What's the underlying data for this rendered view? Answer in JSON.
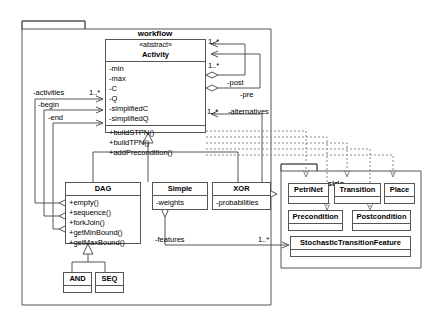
{
  "diagram": {
    "kind": "uml-class-diagram",
    "width": 446,
    "height": 324,
    "line_color": "#555555",
    "dashed_color": "#888888",
    "background": "#ffffff"
  },
  "packages": [
    {
      "id": "workflow",
      "label": "workflow"
    },
    {
      "id": "sirio",
      "label": "sirio"
    }
  ],
  "classes": {
    "activity": {
      "stereotype": "«abstract»",
      "name": "Activity",
      "attributes": [
        "-min",
        "-max",
        "-C",
        "-Q",
        "-simplifiedC",
        "-simplifiedQ"
      ],
      "operations": [
        "+buildSTPN()",
        "+buildTPN()",
        "+addPrecondition()"
      ]
    },
    "dag": {
      "name": "DAG",
      "operations": [
        "+empty()",
        "+sequence()",
        "+forkJoin()",
        "+getMinBound()",
        "+getMaxBound()"
      ]
    },
    "simple": {
      "name": "Simple",
      "attributes": [
        "-weights"
      ]
    },
    "xor": {
      "name": "XOR",
      "attributes": [
        "-probabilities"
      ]
    },
    "and": {
      "name": "AND",
      "attributes": []
    },
    "seq": {
      "name": "SEQ",
      "attributes": []
    },
    "petrinet": {
      "name": "PetriNet",
      "attributes": []
    },
    "transition": {
      "name": "Transition",
      "attributes": []
    },
    "place": {
      "name": "Place",
      "attributes": []
    },
    "precondition": {
      "name": "Precondition",
      "attributes": []
    },
    "postcondition": {
      "name": "Postcondition",
      "attributes": []
    },
    "stochastic_transition_feature": {
      "name": "StochasticTransitionFeature",
      "attributes": []
    }
  },
  "edge_labels": {
    "activities": "-activities",
    "begin": "-begin",
    "end": "-end",
    "post": "-post",
    "pre": "-pre",
    "alternatives": "-alternatives",
    "features": "-features",
    "mult_post": "1..*",
    "mult_pre": "1..*",
    "mult_activities": "1..*",
    "mult_alternatives": "1..*",
    "mult_features": "1..*"
  },
  "relationships": [
    {
      "type": "generalization",
      "from": "dag",
      "to": "activity"
    },
    {
      "type": "generalization",
      "from": "simple",
      "to": "activity"
    },
    {
      "type": "generalization",
      "from": "xor",
      "to": "activity"
    },
    {
      "type": "generalization",
      "from": "and",
      "to": "dag"
    },
    {
      "type": "generalization",
      "from": "seq",
      "to": "dag"
    },
    {
      "type": "aggregation",
      "from": "activity",
      "to": "activity",
      "label": "-post",
      "multiplicity": "1..*"
    },
    {
      "type": "aggregation",
      "from": "activity",
      "to": "activity",
      "label": "-pre",
      "multiplicity": "1..*"
    },
    {
      "type": "aggregation",
      "from": "dag",
      "to": "activity",
      "label": "-activities",
      "multiplicity": "1..*"
    },
    {
      "type": "aggregation",
      "from": "dag",
      "to": "activity",
      "label": "-begin"
    },
    {
      "type": "aggregation",
      "from": "dag",
      "to": "activity",
      "label": "-end"
    },
    {
      "type": "aggregation",
      "from": "xor",
      "to": "activity",
      "label": "-alternatives",
      "multiplicity": "1..*"
    },
    {
      "type": "aggregation",
      "from": "simple",
      "to": "stochastic_transition_feature",
      "label": "-features",
      "multiplicity": "1..*"
    },
    {
      "type": "dependency",
      "from": "activity",
      "to": "petrinet"
    },
    {
      "type": "dependency",
      "from": "activity",
      "to": "transition"
    },
    {
      "type": "dependency",
      "from": "activity",
      "to": "place"
    },
    {
      "type": "dependency",
      "from": "activity",
      "to": "precondition"
    },
    {
      "type": "dependency",
      "from": "activity",
      "to": "postcondition"
    }
  ]
}
